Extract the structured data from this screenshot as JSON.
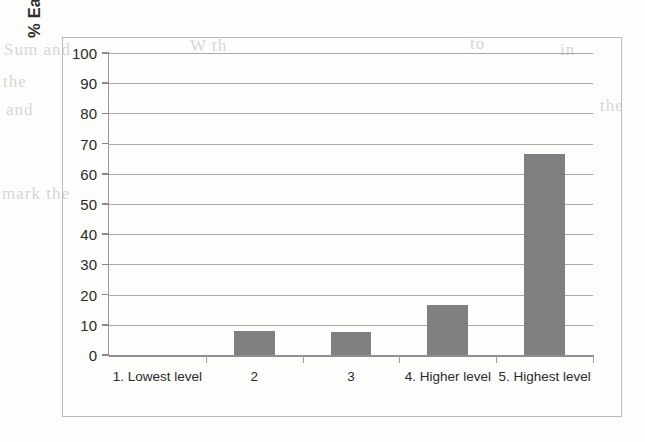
{
  "chart_data": {
    "type": "bar",
    "title": "",
    "xlabel": "",
    "ylabel": "% Easiness in interaction",
    "categories": [
      "1. Lowest level",
      "2",
      "3",
      "4. Higher level",
      "5. Highest level"
    ],
    "values": [
      0,
      7.8,
      7.6,
      16.4,
      66.4
    ],
    "ylim": [
      0,
      100
    ],
    "ytick_labels": [
      "100",
      "90",
      "80",
      "70",
      "60",
      "50",
      "40",
      "30",
      "20",
      "10",
      "0"
    ],
    "ytick_values": [
      100,
      90,
      80,
      70,
      60,
      50,
      40,
      30,
      20,
      10,
      0
    ],
    "grid": true,
    "legend": false,
    "bar_color": "#7f7f7f",
    "gridline_color": "#a9a9a9",
    "axis_color": "#8f8f8f",
    "text_color": "#2b2b2b",
    "background_color": "#fdfdfc"
  },
  "figure": {
    "border_color": "#b9b9b9"
  },
  "artifacts": {
    "bleed_lines": [
      {
        "text": "Sum and",
        "x": 4,
        "y": 40
      },
      {
        "text": "the",
        "x": 3,
        "y": 72
      },
      {
        "text": "and",
        "x": 6,
        "y": 100
      },
      {
        "text": "mark the",
        "x": 2,
        "y": 184
      },
      {
        "text": "W  th",
        "x": 190,
        "y": 36
      },
      {
        "text": "to",
        "x": 470,
        "y": 34
      },
      {
        "text": "in",
        "x": 560,
        "y": 40
      },
      {
        "text": "the",
        "x": 600,
        "y": 96
      }
    ]
  }
}
